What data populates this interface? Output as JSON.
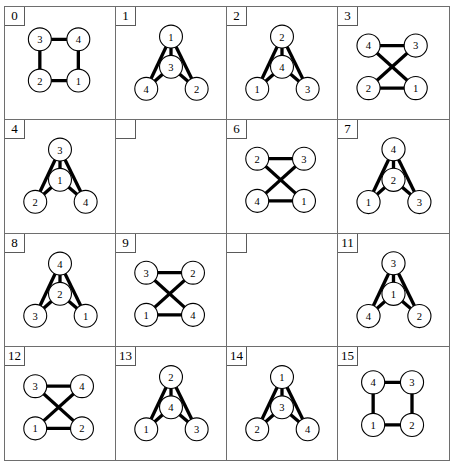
{
  "figure": {
    "type": "graph-grid",
    "rows": 4,
    "columns": 4,
    "node_count_per_graph": 4,
    "edge_color": "#000000",
    "node_fill": "#ffffff",
    "node_stroke": "#000000",
    "background": "#ffffff",
    "grid_line_color": "#6e6e6e"
  },
  "cells": [
    {
      "label": "0",
      "empty": false,
      "layout": "square",
      "nodes": [
        {
          "id": "3",
          "x": 38,
          "y": 34
        },
        {
          "id": "4",
          "x": 80,
          "y": 34
        },
        {
          "id": "2",
          "x": 38,
          "y": 79
        },
        {
          "id": "1",
          "x": 80,
          "y": 79
        }
      ],
      "edges": [
        [
          "3",
          "4"
        ],
        [
          "3",
          "2"
        ],
        [
          "2",
          "1"
        ],
        [
          "1",
          "4"
        ]
      ]
    },
    {
      "label": "1",
      "empty": false,
      "layout": "triangle-center",
      "nodes": [
        {
          "id": "1",
          "x": 60,
          "y": 31
        },
        {
          "id": "3",
          "x": 60,
          "y": 64
        },
        {
          "id": "4",
          "x": 33,
          "y": 88
        },
        {
          "id": "2",
          "x": 88,
          "y": 88
        }
      ],
      "edges": [
        [
          "1",
          "4"
        ],
        [
          "1",
          "2"
        ],
        [
          "1",
          "3"
        ],
        [
          "3",
          "4"
        ],
        [
          "3",
          "2"
        ]
      ]
    },
    {
      "label": "2",
      "empty": false,
      "layout": "triangle-center",
      "nodes": [
        {
          "id": "2",
          "x": 60,
          "y": 31
        },
        {
          "id": "4",
          "x": 60,
          "y": 64
        },
        {
          "id": "1",
          "x": 33,
          "y": 88
        },
        {
          "id": "3",
          "x": 88,
          "y": 88
        }
      ],
      "edges": [
        [
          "2",
          "1"
        ],
        [
          "2",
          "3"
        ],
        [
          "2",
          "4"
        ],
        [
          "4",
          "1"
        ],
        [
          "4",
          "3"
        ]
      ]
    },
    {
      "label": "3",
      "empty": false,
      "layout": "crossed-square",
      "nodes": [
        {
          "id": "4",
          "x": 33,
          "y": 41
        },
        {
          "id": "3",
          "x": 84,
          "y": 41
        },
        {
          "id": "2",
          "x": 33,
          "y": 87
        },
        {
          "id": "1",
          "x": 84,
          "y": 87
        }
      ],
      "edges": [
        [
          "4",
          "3"
        ],
        [
          "2",
          "1"
        ],
        [
          "4",
          "1"
        ],
        [
          "3",
          "2"
        ]
      ]
    },
    {
      "label": "4",
      "empty": false,
      "layout": "triangle-center",
      "nodes": [
        {
          "id": "3",
          "x": 60,
          "y": 31
        },
        {
          "id": "1",
          "x": 60,
          "y": 64
        },
        {
          "id": "2",
          "x": 33,
          "y": 88
        },
        {
          "id": "4",
          "x": 88,
          "y": 88
        }
      ],
      "edges": [
        [
          "3",
          "2"
        ],
        [
          "3",
          "4"
        ],
        [
          "3",
          "1"
        ],
        [
          "1",
          "2"
        ],
        [
          "1",
          "4"
        ]
      ]
    },
    {
      "label": "",
      "empty": true,
      "layout": "none",
      "nodes": [],
      "edges": []
    },
    {
      "label": "6",
      "empty": false,
      "layout": "crossed-square",
      "nodes": [
        {
          "id": "2",
          "x": 33,
          "y": 41
        },
        {
          "id": "3",
          "x": 84,
          "y": 41
        },
        {
          "id": "4",
          "x": 33,
          "y": 87
        },
        {
          "id": "1",
          "x": 84,
          "y": 87
        }
      ],
      "edges": [
        [
          "2",
          "3"
        ],
        [
          "4",
          "1"
        ],
        [
          "2",
          "1"
        ],
        [
          "3",
          "4"
        ]
      ]
    },
    {
      "label": "7",
      "empty": false,
      "layout": "triangle-center",
      "nodes": [
        {
          "id": "4",
          "x": 60,
          "y": 31
        },
        {
          "id": "2",
          "x": 60,
          "y": 64
        },
        {
          "id": "1",
          "x": 33,
          "y": 88
        },
        {
          "id": "3",
          "x": 88,
          "y": 88
        }
      ],
      "edges": [
        [
          "4",
          "1"
        ],
        [
          "4",
          "3"
        ],
        [
          "4",
          "2"
        ],
        [
          "2",
          "1"
        ],
        [
          "2",
          "3"
        ]
      ]
    },
    {
      "label": "8",
      "empty": false,
      "layout": "triangle-center",
      "nodes": [
        {
          "id": "4",
          "x": 60,
          "y": 31
        },
        {
          "id": "2",
          "x": 60,
          "y": 64
        },
        {
          "id": "3",
          "x": 33,
          "y": 88
        },
        {
          "id": "1",
          "x": 88,
          "y": 88
        }
      ],
      "edges": [
        [
          "4",
          "3"
        ],
        [
          "4",
          "1"
        ],
        [
          "4",
          "2"
        ],
        [
          "2",
          "3"
        ],
        [
          "2",
          "1"
        ]
      ]
    },
    {
      "label": "9",
      "empty": false,
      "layout": "crossed-square",
      "nodes": [
        {
          "id": "3",
          "x": 33,
          "y": 41
        },
        {
          "id": "2",
          "x": 84,
          "y": 41
        },
        {
          "id": "1",
          "x": 33,
          "y": 87
        },
        {
          "id": "4",
          "x": 84,
          "y": 87
        }
      ],
      "edges": [
        [
          "3",
          "2"
        ],
        [
          "1",
          "4"
        ],
        [
          "3",
          "4"
        ],
        [
          "2",
          "1"
        ]
      ]
    },
    {
      "label": "",
      "empty": true,
      "layout": "none",
      "nodes": [],
      "edges": []
    },
    {
      "label": "11",
      "empty": false,
      "layout": "triangle-center",
      "nodes": [
        {
          "id": "3",
          "x": 60,
          "y": 31
        },
        {
          "id": "1",
          "x": 60,
          "y": 64
        },
        {
          "id": "4",
          "x": 33,
          "y": 88
        },
        {
          "id": "2",
          "x": 88,
          "y": 88
        }
      ],
      "edges": [
        [
          "3",
          "4"
        ],
        [
          "3",
          "2"
        ],
        [
          "3",
          "1"
        ],
        [
          "1",
          "4"
        ],
        [
          "1",
          "2"
        ]
      ]
    },
    {
      "label": "12",
      "empty": false,
      "layout": "crossed-square",
      "nodes": [
        {
          "id": "3",
          "x": 33,
          "y": 41
        },
        {
          "id": "4",
          "x": 84,
          "y": 41
        },
        {
          "id": "1",
          "x": 33,
          "y": 87
        },
        {
          "id": "2",
          "x": 84,
          "y": 87
        }
      ],
      "edges": [
        [
          "3",
          "4"
        ],
        [
          "1",
          "2"
        ],
        [
          "3",
          "2"
        ],
        [
          "4",
          "1"
        ]
      ]
    },
    {
      "label": "13",
      "empty": false,
      "layout": "triangle-center",
      "nodes": [
        {
          "id": "2",
          "x": 60,
          "y": 31
        },
        {
          "id": "4",
          "x": 60,
          "y": 64
        },
        {
          "id": "1",
          "x": 33,
          "y": 88
        },
        {
          "id": "3",
          "x": 88,
          "y": 88
        }
      ],
      "edges": [
        [
          "2",
          "1"
        ],
        [
          "2",
          "3"
        ],
        [
          "2",
          "4"
        ],
        [
          "4",
          "1"
        ],
        [
          "4",
          "3"
        ]
      ]
    },
    {
      "label": "14",
      "empty": false,
      "layout": "triangle-center",
      "nodes": [
        {
          "id": "1",
          "x": 60,
          "y": 31
        },
        {
          "id": "3",
          "x": 60,
          "y": 64
        },
        {
          "id": "2",
          "x": 33,
          "y": 88
        },
        {
          "id": "4",
          "x": 88,
          "y": 88
        }
      ],
      "edges": [
        [
          "1",
          "2"
        ],
        [
          "1",
          "4"
        ],
        [
          "1",
          "3"
        ],
        [
          "3",
          "2"
        ],
        [
          "3",
          "4"
        ]
      ]
    },
    {
      "label": "15",
      "empty": false,
      "layout": "square",
      "nodes": [
        {
          "id": "4",
          "x": 38,
          "y": 37
        },
        {
          "id": "3",
          "x": 80,
          "y": 37
        },
        {
          "id": "1",
          "x": 38,
          "y": 83
        },
        {
          "id": "2",
          "x": 80,
          "y": 83
        }
      ],
      "edges": [
        [
          "4",
          "3"
        ],
        [
          "4",
          "1"
        ],
        [
          "1",
          "2"
        ],
        [
          "2",
          "3"
        ]
      ]
    }
  ]
}
